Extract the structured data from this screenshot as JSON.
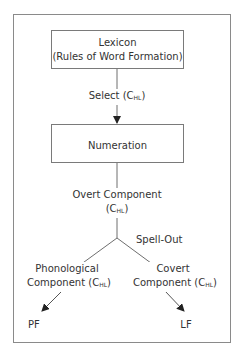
{
  "diagram": {
    "nodes": {
      "lexicon": {
        "line1": "Lexicon",
        "line2": "(Rules of Word Formation)"
      },
      "numeration": {
        "label": "Numeration"
      },
      "overt": {
        "line1": "Overt Component",
        "line2_prefix": "(C",
        "line2_sub": "HL",
        "line2_suffix": ")"
      },
      "phonological": {
        "line1": "Phonological",
        "line2_prefix": "Component (C",
        "line2_sub": "HL",
        "line2_suffix": ")"
      },
      "covert": {
        "line1": "Covert",
        "line2_prefix": "Component (C",
        "line2_sub": "HL",
        "line2_suffix": ")"
      },
      "pf": {
        "label": "PF"
      },
      "lf": {
        "label": "LF"
      }
    },
    "edges": {
      "select": {
        "prefix": "Select (C",
        "sub": "HL",
        "suffix": ")"
      },
      "spellout": {
        "label": "Spell-Out"
      }
    },
    "colors": {
      "line": "#6e6e6e",
      "frame": "#8a8a8a",
      "text": "#333333"
    }
  }
}
